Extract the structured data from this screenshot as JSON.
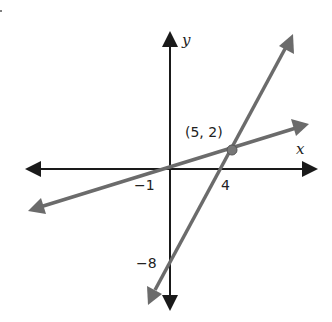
{
  "diagram": {
    "type": "coordinate-plane-two-lines",
    "axes": {
      "x_label": "x",
      "y_label": "y",
      "color": "#1a1a1a"
    },
    "lines": [
      {
        "name": "shallow-line",
        "color": "#6b6b6b",
        "x_intercept": -1,
        "passes_through": [
          5,
          2
        ]
      },
      {
        "name": "steep-line",
        "color": "#6b6b6b",
        "x_intercept": 4,
        "y_intercept": -8,
        "passes_through": [
          5,
          2
        ]
      }
    ],
    "intersection": {
      "label": "(5, 2)",
      "x": 5,
      "y": 2
    },
    "tick_labels": {
      "x_neg1": "−1",
      "x_4": "4",
      "y_neg8": "−8"
    }
  }
}
